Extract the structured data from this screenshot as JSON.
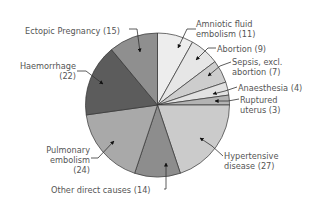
{
  "chart_data": {
    "type": "pie",
    "title": "",
    "start_angle_deg": 0,
    "direction": "clockwise",
    "total": 136,
    "slices": [
      {
        "label": "Amniotic fluid embolism",
        "value": 11,
        "color": "#ededed"
      },
      {
        "label": "Abortion",
        "value": 9,
        "color": "#e6e6e6"
      },
      {
        "label": "Sepsis, excl. abortion",
        "value": 7,
        "color": "#cdcdcd"
      },
      {
        "label": "Anaesthesia",
        "value": 4,
        "color": "#e2e2e2"
      },
      {
        "label": "Ruptured uterus",
        "value": 3,
        "color": "#b3b3b3"
      },
      {
        "label": "Hypertensive disease",
        "value": 27,
        "color": "#cbcbcb"
      },
      {
        "label": "Other direct causes",
        "value": 14,
        "color": "#8d8d8d"
      },
      {
        "label": "Pulmonary embolism",
        "value": 24,
        "color": "#a9a9a9"
      },
      {
        "label": "Haemorrhage",
        "value": 22,
        "color": "#5c5c5c"
      },
      {
        "label": "Ectopic Pregnancy",
        "value": 15,
        "color": "#8f8f8f"
      }
    ],
    "labels": {
      "amniotic": [
        "Amniotic fluid",
        "embolism (11)"
      ],
      "abortion": [
        "Abortion (9)"
      ],
      "sepsis": [
        "Sepsis, excl.",
        "abortion (7)"
      ],
      "anaesthesia": [
        "Anaesthesia (4)"
      ],
      "ruptured": [
        "Ruptured",
        "uterus (3)"
      ],
      "hypertensive": [
        "Hypertensive",
        "disease (27)"
      ],
      "other": [
        "Other direct causes (14)"
      ],
      "pulmonary": [
        "Pulmonary",
        "embolism",
        "(24)"
      ],
      "haemorrhage": [
        "Haemorrhage",
        "(22)"
      ],
      "ectopic": [
        "Ectopic Pregnancy (15)"
      ]
    },
    "legend": "none (callout labels)",
    "grid": false
  }
}
